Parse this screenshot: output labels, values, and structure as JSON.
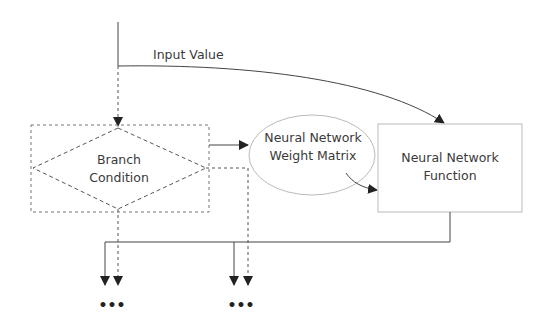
{
  "diagram": {
    "edges": {
      "input": {
        "label": "Input Value"
      }
    },
    "nodes": {
      "branch": {
        "line1": "Branch",
        "line2": "Condition"
      },
      "weights": {
        "line1": "Neural Network",
        "line2": "Weight Matrix"
      },
      "function": {
        "line1": "Neural Network",
        "line2": "Function"
      }
    },
    "outputs": {
      "left_ellipsis": "•••",
      "right_ellipsis": "•••"
    },
    "colors": {
      "line": "#444444",
      "dashed": "#555555",
      "box_border": "#bbbbbb",
      "text": "#3a3a3a"
    }
  }
}
